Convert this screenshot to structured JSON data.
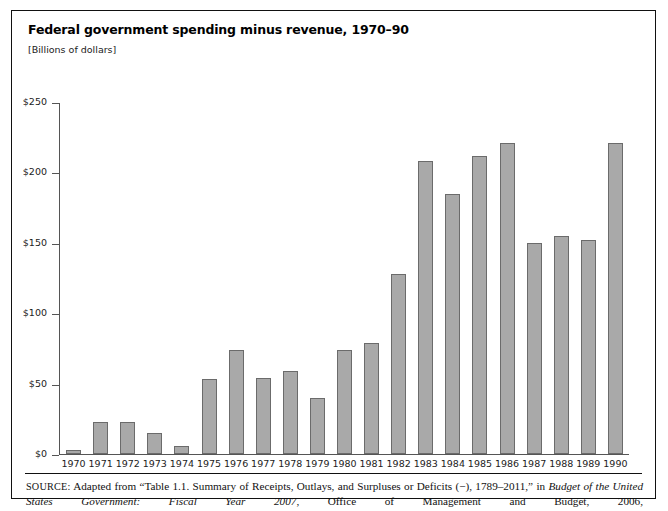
{
  "figure": {
    "title": "Federal government spending minus revenue, 1970–90",
    "units": "[Billions of dollars]",
    "source_label": "SOURCE:",
    "source_text_1": " Adapted from “Table 1.1. Summary of Receipts, Outlays, and Surpluses or Deficits (−), 1789–2011,” in ",
    "source_italic_1": "Budget of the United States Government: Fiscal Year 2007",
    "source_text_2": ", Office of Management and Budget, 2006, http://www.gpoaccess.gov/usbudget/fy07/sheets/hist01z1.xls (accessed June 10, 2008)"
  },
  "colors": {
    "bar_fill": "#a9a9a9",
    "bar_stroke": "#6b6b6b",
    "axis": "#555555",
    "frame": "#111111"
  },
  "chart_data": {
    "type": "bar",
    "title": "Federal government spending minus revenue, 1970–90",
    "subtitle": "[Billions of dollars]",
    "xlabel": "",
    "ylabel": "[Billions of dollars]",
    "ylim": [
      0,
      250
    ],
    "yticks": [
      0,
      50,
      100,
      150,
      200,
      250
    ],
    "ytick_labels": [
      "$0",
      "$50",
      "$100",
      "$150",
      "$200",
      "$250"
    ],
    "grid": false,
    "legend": null,
    "categories": [
      "1970",
      "1971",
      "1972",
      "1973",
      "1974",
      "1975",
      "1976",
      "1977",
      "1978",
      "1979",
      "1980",
      "1981",
      "1982",
      "1983",
      "1984",
      "1985",
      "1986",
      "1987",
      "1988",
      "1989",
      "1990"
    ],
    "values": [
      3,
      23,
      23,
      15,
      6,
      53,
      74,
      54,
      59,
      40,
      74,
      79,
      128,
      208,
      185,
      212,
      221,
      150,
      155,
      152,
      221
    ]
  }
}
